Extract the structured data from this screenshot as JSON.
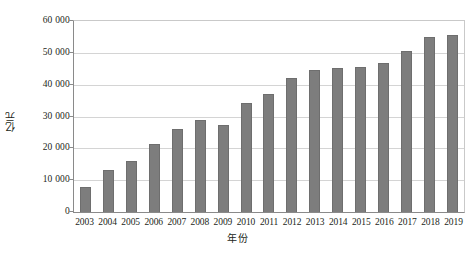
{
  "chart_data": {
    "type": "bar",
    "title": "",
    "xlabel": "年份",
    "ylabel": "亿元",
    "categories": [
      "2003",
      "2004",
      "2005",
      "2006",
      "2007",
      "2008",
      "2009",
      "2010",
      "2011",
      "2012",
      "2013",
      "2014",
      "2015",
      "2016",
      "2017",
      "2018",
      "2019"
    ],
    "values": [
      8000,
      13300,
      16000,
      21500,
      26000,
      28800,
      27300,
      34200,
      37000,
      42000,
      44500,
      45300,
      45700,
      46700,
      50600,
      55000,
      55700
    ],
    "ylim": [
      0,
      60000
    ],
    "ytick_values": [
      0,
      10000,
      20000,
      30000,
      40000,
      50000,
      60000
    ],
    "ytick_labels": [
      "0",
      "10 000",
      "20 000",
      "30 000",
      "40 000",
      "50 000",
      "60 000"
    ],
    "grid": true,
    "legend": "none",
    "series": [
      {
        "name": "亿元",
        "color": "#7d7d7d",
        "values": [
          8000,
          13300,
          16000,
          21500,
          26000,
          28800,
          27300,
          34200,
          37000,
          42000,
          44500,
          45300,
          45700,
          46700,
          50600,
          55000,
          55700
        ]
      }
    ],
    "colors": {
      "bar": "#7d7d7d",
      "gridline": "#d4d4d4",
      "axis": "#8a8a8a",
      "text": "#231f20",
      "background": "#ffffff"
    }
  }
}
